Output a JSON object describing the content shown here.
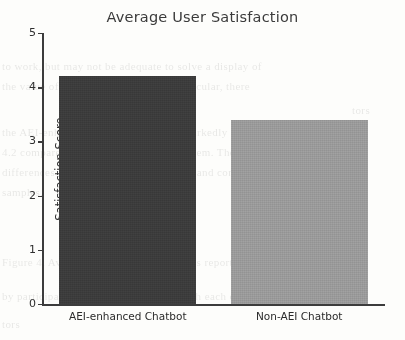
{
  "chart_data": {
    "type": "bar",
    "title": "Average User Satisfaction",
    "xlabel": "",
    "ylabel": "Satisfaction Score",
    "categories": [
      "AEI-enhanced Chatbot",
      "Non-AEI Chatbot"
    ],
    "values": [
      4.2,
      3.4
    ],
    "ylim": [
      0,
      5
    ],
    "ytick_labels": [
      "0",
      "1",
      "2",
      "3",
      "4",
      "5"
    ],
    "ytick_values": [
      0,
      1,
      2,
      3,
      4,
      5
    ],
    "grid": false,
    "legend": "none",
    "bar_colors": [
      "#3c3c3c",
      "#9a9a9a"
    ],
    "axis_color": "#3c3c3c",
    "background_color": "#fdfdfb"
  },
  "background_text": {
    "lines": [
      "to work, but may not be adequate to solve a display of",
      "the value of a human supervisor. In particular, there",
      "tors",
      "the AEI-enhanced chatbot achieved a markedly higher",
      "4.2 compared to 3.4 for the baseline system. These",
      "differences were statistically significant and consistent",
      "samples.",
      "Figure 4. Average user satisfaction scores reported",
      "by participants following interaction with each of the",
      "two chatbot variants across the evaluation period."
    ]
  }
}
